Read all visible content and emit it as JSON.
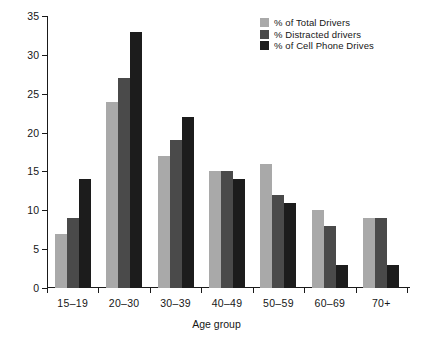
{
  "chart_data": {
    "type": "bar",
    "title": "",
    "xlabel": "Age group",
    "ylabel": "",
    "categories": [
      "15–19",
      "20–30",
      "30–39",
      "40–49",
      "50–59",
      "60–69",
      "70+"
    ],
    "series": [
      {
        "name": "% of Total Drivers",
        "color": "#a9a9a9",
        "values": [
          7,
          24,
          17,
          15,
          16,
          10,
          9
        ]
      },
      {
        "name": "% Distracted drivers",
        "color": "#4a4a4a",
        "values": [
          9,
          27,
          19,
          15,
          12,
          8,
          9
        ]
      },
      {
        "name": "% of Cell Phone Drives",
        "color": "#1c1c1c",
        "values": [
          14,
          33,
          22,
          14,
          11,
          3,
          3
        ]
      }
    ],
    "ylim": [
      0,
      35
    ],
    "yticks": [
      0,
      5,
      10,
      15,
      20,
      25,
      30,
      35
    ],
    "ytick_labels": [
      "0",
      "5",
      "10",
      "15",
      "20",
      "25",
      "30",
      "35"
    ],
    "grid": false,
    "legend_position": "top-right"
  },
  "legend": {
    "items": [
      {
        "label": "% of Total Drivers",
        "color": "#a9a9a9"
      },
      {
        "label": "% Distracted drivers",
        "color": "#4a4a4a"
      },
      {
        "label": "% of Cell Phone Drives",
        "color": "#1c1c1c"
      }
    ]
  },
  "axes": {
    "x_title": "Age group",
    "y_tick_labels": [
      "35",
      "30",
      "25",
      "20",
      "15",
      "10",
      "5",
      "0"
    ],
    "x_tick_labels": [
      "15–19",
      "20–30",
      "30–39",
      "40–49",
      "50–59",
      "60–69",
      "70+"
    ]
  }
}
